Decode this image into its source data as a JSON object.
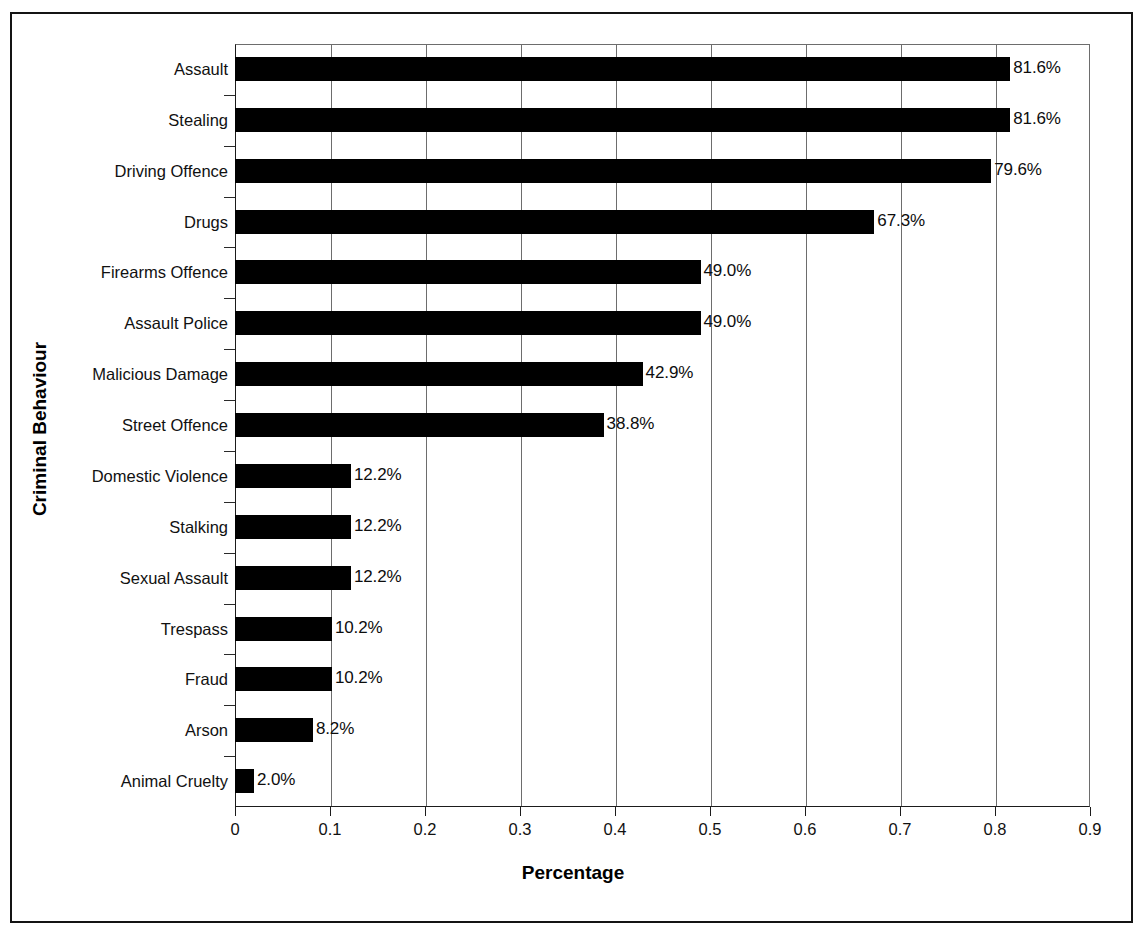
{
  "chart_data": {
    "type": "bar",
    "orientation": "horizontal",
    "title": "",
    "xlabel": "Percentage",
    "ylabel": "Criminal Behaviour",
    "xlim": [
      0,
      0.9
    ],
    "xticks": [
      "0",
      "0.1",
      "0.2",
      "0.3",
      "0.4",
      "0.5",
      "0.6",
      "0.7",
      "0.8",
      "0.9"
    ],
    "xtick_values": [
      0,
      0.1,
      0.2,
      0.3,
      0.4,
      0.5,
      0.6,
      0.7,
      0.8,
      0.9
    ],
    "grid": true,
    "grid_axis": "x",
    "legend": "none",
    "bar_color": "#000000",
    "categories": [
      "Assault",
      "Stealing",
      "Driving Offence",
      "Drugs",
      "Firearms Offence",
      "Assault Police",
      "Malicious Damage",
      "Street Offence",
      "Domestic Violence",
      "Stalking",
      "Sexual Assault",
      "Trespass",
      "Fraud",
      "Arson",
      "Animal Cruelty"
    ],
    "values": [
      0.816,
      0.816,
      0.796,
      0.673,
      0.49,
      0.49,
      0.429,
      0.388,
      0.122,
      0.122,
      0.122,
      0.102,
      0.102,
      0.082,
      0.02
    ],
    "data_labels": [
      "81.6%",
      "81.6%",
      "79.6%",
      "67.3%",
      "49.0%",
      "49.0%",
      "42.9%",
      "38.8%",
      "12.2%",
      "12.2%",
      "12.2%",
      "10.2%",
      "10.2%",
      "8.2%",
      "2.0%"
    ]
  }
}
